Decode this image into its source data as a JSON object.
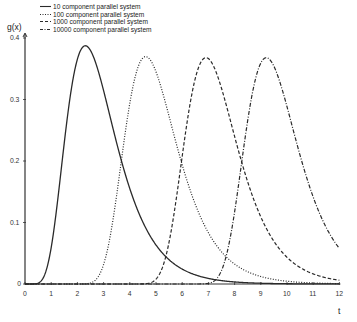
{
  "chart_data": {
    "type": "line",
    "title": "",
    "xlabel": "t",
    "ylabel": "g(x)",
    "xlim": [
      0,
      12
    ],
    "ylim": [
      0,
      0.4
    ],
    "grid": false,
    "legend_position": "top-left",
    "x_ticks": [
      "0",
      "1",
      "2",
      "3",
      "4",
      "5",
      "6",
      "7",
      "8",
      "9",
      "10",
      "11",
      "12"
    ],
    "y_ticks": [
      "0",
      "0.1",
      "0.2",
      "0.3",
      "0.4"
    ],
    "formula": "g(t) = n e^{-t} (1 - e^{-t})^{n-1}",
    "series": [
      {
        "name": "10 component parallel system",
        "n": 10,
        "style": "solid",
        "peak_t": 2.3,
        "peak_value": 0.387
      },
      {
        "name": "100 component parallel system",
        "n": 100,
        "style": "dotted",
        "peak_t": 4.61,
        "peak_value": 0.37
      },
      {
        "name": "1000 component parallel system",
        "n": 1000,
        "style": "dashed",
        "peak_t": 6.91,
        "peak_value": 0.368
      },
      {
        "name": "10000 component parallel system",
        "n": 10000,
        "style": "dashdot",
        "peak_t": 9.21,
        "peak_value": 0.368
      }
    ]
  },
  "legend": {
    "items": [
      {
        "label": "10 component parallel system"
      },
      {
        "label": "100 component parallel system"
      },
      {
        "label": "1000 component parallel system"
      },
      {
        "label": "10000 component parallel system"
      }
    ]
  },
  "axes": {
    "ylabel": "g(x)",
    "xlabel": "t"
  },
  "colors": {
    "line": "#2a2a2a",
    "axis": "#333333"
  }
}
